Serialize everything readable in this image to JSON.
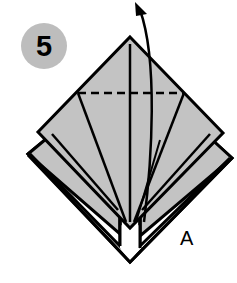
{
  "diagram": {
    "type": "origami-step",
    "step_number": "5",
    "point_label": "A",
    "colors": {
      "paper": "#c3c3c3",
      "line": "#000000",
      "step_badge": "#bdbdbd",
      "background": "#ffffff"
    },
    "annotations": {
      "valley_fold_line": "dashed horizontal fold",
      "arrow": "fold direction arrow pointing up"
    }
  }
}
